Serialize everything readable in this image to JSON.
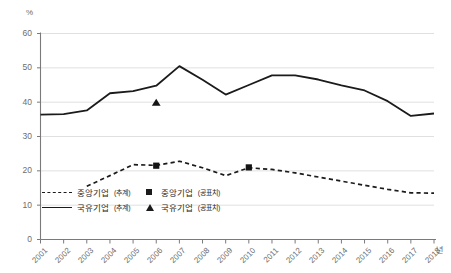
{
  "chart": {
    "unit_label": "%",
    "x_axis_unit": "년",
    "y_ticks": [
      "60",
      "50",
      "40",
      "30",
      "20",
      "10",
      "0"
    ],
    "x_ticks": [
      "2001",
      "2002",
      "2003",
      "2004",
      "2005",
      "2006",
      "2007",
      "2008",
      "2009",
      "2010",
      "2011",
      "2012",
      "2013",
      "2014",
      "2015",
      "2016",
      "2017",
      "2018"
    ]
  },
  "legend": {
    "items": [
      {
        "label": "중앙기업",
        "suffix": "(추계)",
        "key": "dash",
        "name": "legend-central-estimate"
      },
      {
        "label": "중앙기업",
        "suffix": "(공표치)",
        "key": "sq",
        "name": "legend-central-published"
      },
      {
        "label": "국유기업",
        "suffix": "(추계)",
        "key": "solid",
        "name": "legend-soe-estimate"
      },
      {
        "label": "국유기업",
        "suffix": "(공표치)",
        "key": "tri",
        "name": "legend-soe-published"
      }
    ]
  },
  "chart_data": {
    "type": "line",
    "title": "",
    "xlabel": "년",
    "ylabel": "%",
    "ylim": [
      0,
      60
    ],
    "yticks": [
      0,
      10,
      20,
      30,
      40,
      50,
      60
    ],
    "grid": true,
    "legend_position": "bottom-left",
    "x": [
      2001,
      2002,
      2003,
      2004,
      2005,
      2006,
      2007,
      2008,
      2009,
      2010,
      2011,
      2012,
      2013,
      2014,
      2015,
      2016,
      2017,
      2018
    ],
    "series": [
      {
        "name": "국유기업(추계)",
        "style": "solid",
        "values": [
          36.4,
          36.5,
          37.6,
          42.6,
          43.2,
          44.8,
          50.5,
          46.5,
          42.2,
          45.0,
          47.8,
          47.8,
          46.6,
          44.9,
          43.4,
          40.3,
          36.0,
          36.7
        ]
      },
      {
        "name": "중앙기업(추계)",
        "style": "dashed",
        "values": [
          null,
          null,
          15.5,
          18.6,
          21.8,
          21.6,
          22.8,
          20.9,
          18.6,
          20.9,
          20.4,
          19.4,
          18.2,
          17.0,
          15.8,
          14.6,
          13.6,
          13.5
        ]
      },
      {
        "name": "중앙기업(공표치)",
        "style": "square-marker",
        "points": [
          {
            "x": 2006,
            "y": 21.5
          },
          {
            "x": 2010,
            "y": 21.0
          }
        ]
      },
      {
        "name": "국유기업(공표치)",
        "style": "triangle-marker",
        "points": [
          {
            "x": 2006,
            "y": 40.0
          }
        ]
      }
    ],
    "annotations": []
  }
}
